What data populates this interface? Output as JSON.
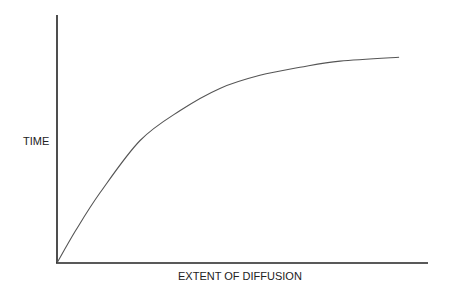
{
  "chart_data": {
    "type": "line",
    "title": "",
    "xlabel": "EXTENT OF DIFFUSION",
    "ylabel": "TIME",
    "xlim": [
      0,
      1
    ],
    "ylim": [
      0,
      1
    ],
    "grid": false,
    "ticks": false,
    "series": [
      {
        "name": "diffusion curve",
        "x": [
          0,
          0.05,
          0.116,
          0.224,
          0.332,
          0.439,
          0.547,
          0.655,
          0.763,
          0.922
        ],
        "y": [
          0,
          0.13,
          0.283,
          0.494,
          0.615,
          0.704,
          0.757,
          0.789,
          0.814,
          0.83
        ]
      }
    ]
  }
}
